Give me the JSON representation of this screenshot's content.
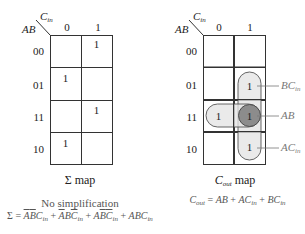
{
  "left_map": {
    "name": "Σ map",
    "row_var": "AB",
    "col_var": "C",
    "col_var_sub": "in",
    "col_headers": [
      "0",
      "1"
    ],
    "row_headers": [
      "00",
      "01",
      "11",
      "10"
    ],
    "cells": [
      [
        "",
        "1"
      ],
      [
        "1",
        ""
      ],
      [
        "",
        "1"
      ],
      [
        "1",
        ""
      ]
    ],
    "caption": "Σ map",
    "note": "No simplification",
    "equation": "Σ = A̅B̅Cin + A̅BC̅in + AB̅C̅in + ABCin"
  },
  "right_map": {
    "row_var": "AB",
    "col_var": "C",
    "col_var_sub": "in",
    "col_headers": [
      "0",
      "1"
    ],
    "row_headers": [
      "00",
      "01",
      "11",
      "10"
    ],
    "cells": [
      [
        "",
        ""
      ],
      [
        "",
        "1"
      ],
      [
        "1",
        "1"
      ],
      [
        "",
        "1"
      ]
    ],
    "caption_main": "C",
    "caption_sub": "out",
    "caption_rest": " map",
    "groups": [
      {
        "label": "BC",
        "sub": "in"
      },
      {
        "label": "AB",
        "sub": ""
      },
      {
        "label": "AC",
        "sub": "in"
      }
    ],
    "equation": "Cout = AB + ACin + BCin"
  },
  "colors": {
    "group_fill": "#e3e3e3",
    "overlap_fill": "#8c8c8c",
    "grid_line": "#333333",
    "label_gray": "#777777"
  }
}
